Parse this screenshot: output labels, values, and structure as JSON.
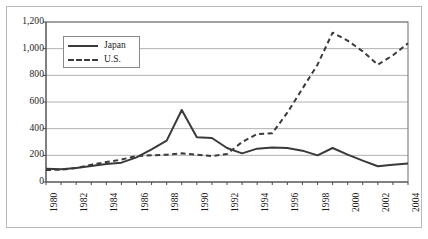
{
  "chart_data": {
    "type": "line",
    "title": "",
    "xlabel": "",
    "ylabel": "",
    "x": [
      1980,
      1981,
      1982,
      1983,
      1984,
      1985,
      1986,
      1987,
      1988,
      1989,
      1990,
      1991,
      1992,
      1993,
      1994,
      1995,
      1996,
      1997,
      1998,
      1999,
      2000,
      2001,
      2002,
      2003,
      2004
    ],
    "xlim": [
      1980,
      2004
    ],
    "ylim": [
      0,
      1200
    ],
    "yticks": [
      0,
      200,
      400,
      600,
      800,
      1000,
      1200
    ],
    "ytick_labels": [
      "0",
      "200",
      "400",
      "600",
      "800",
      "1,000",
      "1,200"
    ],
    "xtick_labels": [
      "1980",
      "1982",
      "1984",
      "1986",
      "1988",
      "1990",
      "1992",
      "1994",
      "1996",
      "1998",
      "2000",
      "2002",
      "2004"
    ],
    "xtick_label_rotation": -90,
    "grid": "horizontal",
    "legend_position": "upper-left-inside",
    "series": [
      {
        "name": "Japan",
        "style": "solid",
        "color": "#3a3a3a",
        "values": [
          100,
          95,
          105,
          120,
          135,
          145,
          185,
          245,
          310,
          540,
          335,
          330,
          255,
          215,
          250,
          258,
          255,
          235,
          200,
          255,
          205,
          160,
          118,
          130,
          138
        ]
      },
      {
        "name": "U.S.",
        "style": "dashed",
        "color": "#3a3a3a",
        "values": [
          90,
          92,
          105,
          130,
          150,
          168,
          195,
          200,
          205,
          215,
          205,
          195,
          210,
          300,
          360,
          365,
          520,
          700,
          880,
          1120,
          1060,
          980,
          880,
          950,
          1040
        ]
      }
    ]
  },
  "legend": {
    "items": [
      {
        "label": "Japan",
        "style": "solid"
      },
      {
        "label": "U.S.",
        "style": "dashed"
      }
    ]
  },
  "colors": {
    "series_line": "#3a3a3a",
    "gridline": "#b0b0b0",
    "axis": "#6e6e6e",
    "outer_frame": "#b9b9b9",
    "background": "#ffffff",
    "text": "#1a1a1a"
  }
}
